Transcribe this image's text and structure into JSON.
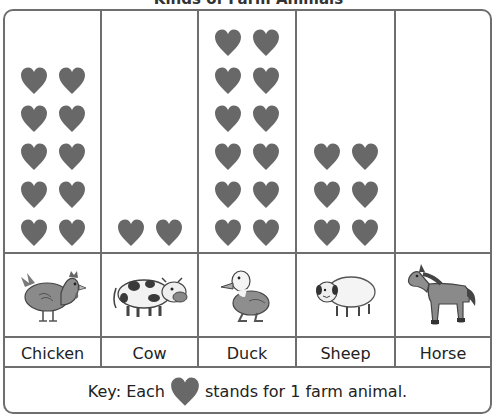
{
  "title": "Kinds of Farm Animals",
  "colors": {
    "heart": "#686868",
    "grid": "#6e6e6e"
  },
  "columns": [
    {
      "label": "Chicken",
      "icon": "chicken-icon",
      "count": 10
    },
    {
      "label": "Cow",
      "icon": "cow-icon",
      "count": 2
    },
    {
      "label": "Duck",
      "icon": "duck-icon",
      "count": 12
    },
    {
      "label": "Sheep",
      "icon": "sheep-icon",
      "count": 6
    },
    {
      "label": "Horse",
      "icon": "horse-icon",
      "count": 0
    }
  ],
  "key": {
    "prefix": "Key: Each",
    "suffix": "stands for 1 farm animal.",
    "symbol": "heart-icon"
  },
  "chart_data": {
    "type": "pictograph",
    "title": "Kinds of Farm Animals",
    "categories": [
      "Chicken",
      "Cow",
      "Duck",
      "Sheep",
      "Horse"
    ],
    "values": [
      10,
      2,
      12,
      6,
      0
    ],
    "symbol": "heart",
    "symbol_value": 1,
    "legend": "Key: Each heart stands for 1 farm animal.",
    "xlabel": "",
    "ylabel": ""
  }
}
